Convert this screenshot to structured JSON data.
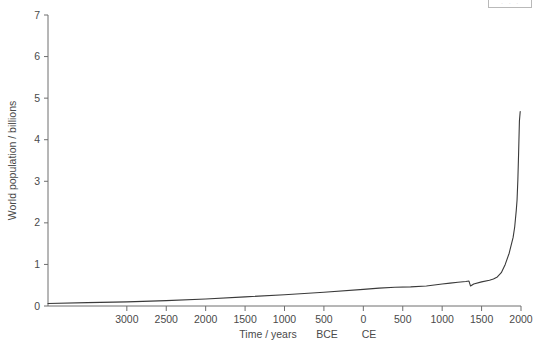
{
  "chart_data": {
    "type": "line",
    "title": "",
    "subtitle": "",
    "xlabel": "Time / years  BCE     CE",
    "xlabel_parts": [
      "Time / years",
      "BCE",
      "CE"
    ],
    "ylabel": "World population / billions",
    "xlim": [
      -4000,
      2000
    ],
    "ylim": [
      0,
      7
    ],
    "grid": false,
    "legend_position": "none",
    "x_tick_labels": [
      "3000",
      "2500",
      "2000",
      "1500",
      "1000",
      "500",
      "0",
      "500",
      "1000",
      "1500",
      "2000"
    ],
    "x_tick_values": [
      -3000,
      -2500,
      -2000,
      -1500,
      -1000,
      -500,
      0,
      500,
      1000,
      1500,
      2000
    ],
    "y_tick_labels": [
      "0",
      "1",
      "2",
      "3",
      "4",
      "5",
      "6",
      "7"
    ],
    "y_tick_values": [
      0,
      1,
      2,
      3,
      4,
      5,
      6,
      7
    ],
    "series": [
      {
        "name": "World population",
        "x": [
          -4000,
          -3500,
          -3000,
          -2500,
          -2000,
          -1500,
          -1000,
          -500,
          0,
          200,
          400,
          600,
          800,
          1000,
          1100,
          1200,
          1300,
          1340,
          1360,
          1400,
          1500,
          1600,
          1650,
          1700,
          1750,
          1800,
          1850,
          1900,
          1920,
          1940,
          1950,
          1960,
          1970,
          1980,
          1990
        ],
        "y": [
          0.06,
          0.08,
          0.1,
          0.13,
          0.17,
          0.22,
          0.27,
          0.33,
          0.4,
          0.43,
          0.45,
          0.46,
          0.48,
          0.53,
          0.55,
          0.57,
          0.59,
          0.6,
          0.48,
          0.53,
          0.58,
          0.62,
          0.65,
          0.7,
          0.8,
          1.0,
          1.27,
          1.65,
          1.9,
          2.3,
          2.55,
          3.03,
          3.7,
          4.45,
          4.68
        ]
      }
    ],
    "annotations": [
      {
        "label": "plague dip",
        "x": 1350,
        "y": 0.48
      }
    ],
    "final_value": 4.68
  },
  "figure": {
    "legend_stub_dots": "· · ·"
  }
}
